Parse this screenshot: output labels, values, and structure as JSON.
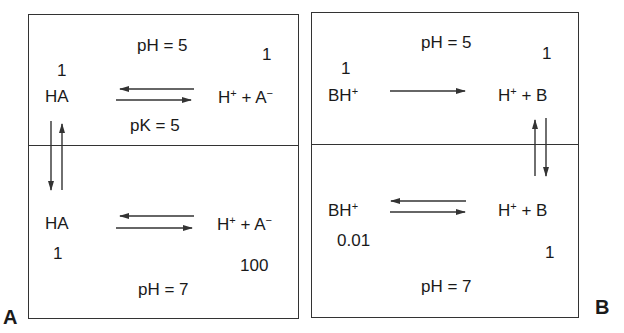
{
  "panels": [
    {
      "label": "A",
      "top": {
        "ph": "pH = 5",
        "left_species": "HA",
        "left_conc": "1",
        "right_species_base": "H",
        "right_species_sup1": "+",
        "right_species_mid": " + A",
        "right_species_sup2": "−",
        "right_conc": "1",
        "pk": "pK = 5",
        "arrow": "equilibrium"
      },
      "bottom": {
        "ph": "pH = 7",
        "left_species": "HA",
        "left_conc": "1",
        "right_species_base": "H",
        "right_species_sup1": "+",
        "right_species_mid": " + A",
        "right_species_sup2": "−",
        "right_conc": "100",
        "arrow": "equilibrium"
      },
      "membrane_transport": "HA crosses membrane (bidirectional)"
    },
    {
      "label": "B",
      "top": {
        "ph": "pH = 5",
        "left_species_base": "BH",
        "left_species_sup": "+",
        "left_conc": "1",
        "right_species_base": "H",
        "right_species_sup": "+",
        "right_species_mid": " + B",
        "right_conc": "1",
        "arrow": "forward"
      },
      "bottom": {
        "ph": "pH = 7",
        "left_species_base": "BH",
        "left_species_sup": "+",
        "left_conc": "0.01",
        "right_species_base": "H",
        "right_species_sup": "+",
        "right_species_mid": " + B",
        "right_conc": "1",
        "arrow": "equilibrium"
      },
      "membrane_transport": "B crosses membrane (bidirectional)"
    }
  ],
  "colors": {
    "line": "#333333",
    "text": "#1a1a1a",
    "background": "#ffffff"
  }
}
